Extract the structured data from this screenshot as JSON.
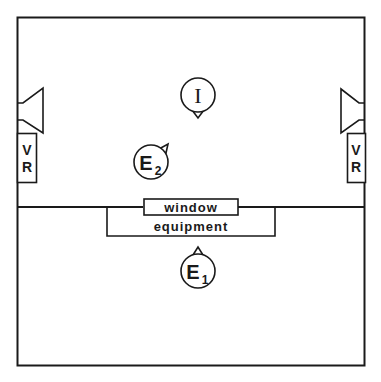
{
  "diagram": {
    "room": {
      "stroke": "#1a1a1a",
      "background": "#ffffff"
    },
    "window_label": "window",
    "equipment_label": "equipment",
    "left_vr": {
      "line1": "V",
      "line2": "R"
    },
    "right_vr": {
      "line1": "V",
      "line2": "R"
    },
    "interviewer": {
      "label": "I"
    },
    "examiner_2": {
      "letter": "E",
      "subscript": "2"
    },
    "examiner_1": {
      "letter": "E",
      "subscript": "1"
    }
  }
}
